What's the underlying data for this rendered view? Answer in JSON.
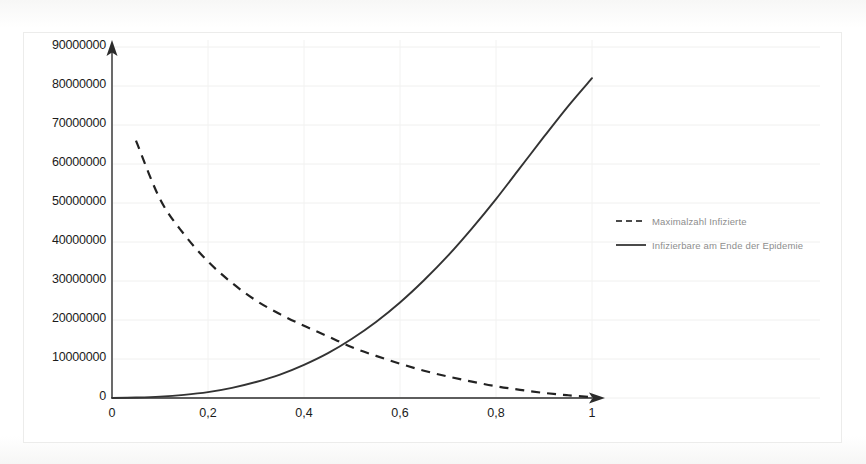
{
  "chart_data": {
    "type": "line",
    "title": "",
    "subtitle": "",
    "xlabel": "",
    "ylabel": "",
    "xlim": [
      0,
      1
    ],
    "ylim": [
      0,
      90000000
    ],
    "grid": true,
    "legend_position": "right",
    "x_tick_labels": [
      "0",
      "0,2",
      "0,4",
      "0,6",
      "0,8",
      "1"
    ],
    "x_tick_values": [
      0,
      0.2,
      0.4,
      0.6,
      0.8,
      1
    ],
    "y_tick_labels": [
      "90000000",
      "80000000",
      "70000000",
      "60000000",
      "50000000",
      "40000000",
      "30000000",
      "20000000",
      "10000000",
      "0"
    ],
    "y_tick_values": [
      90000000,
      80000000,
      70000000,
      60000000,
      50000000,
      40000000,
      30000000,
      20000000,
      10000000,
      0
    ],
    "x": [
      0.05,
      0.1,
      0.15,
      0.2,
      0.25,
      0.3,
      0.35,
      0.4,
      0.45,
      0.5,
      0.55,
      0.6,
      0.65,
      0.7,
      0.75,
      0.8,
      0.85,
      0.9,
      0.95,
      1.0
    ],
    "series": [
      {
        "name": "Maximalzahl Infizierte",
        "style": "dashed",
        "color": "#222222",
        "values": [
          66000000,
          51000000,
          42000000,
          35000000,
          29500000,
          25000000,
          21500000,
          18500000,
          15800000,
          13000000,
          10800000,
          8800000,
          7000000,
          5500000,
          4200000,
          3000000,
          2100000,
          1300000,
          700000,
          200000
        ]
      },
      {
        "name": "Infizierbare am Ende der Epidemie",
        "style": "solid",
        "color": "#333333",
        "values": [
          120000,
          350000,
          800000,
          1500000,
          2600000,
          4100000,
          6000000,
          8500000,
          11500000,
          15200000,
          19500000,
          24500000,
          30200000,
          36500000,
          43500000,
          51000000,
          59000000,
          67000000,
          74800000,
          82000000
        ]
      }
    ],
    "annotations": []
  },
  "legend": {
    "items": [
      {
        "label": "Maximalzahl Infizierte",
        "style": "dashed"
      },
      {
        "label": "Infizierbare am Ende der Epidemie",
        "style": "solid"
      }
    ]
  },
  "axes": {
    "y_ticks": [
      {
        "label": "90000000"
      },
      {
        "label": "80000000"
      },
      {
        "label": "70000000"
      },
      {
        "label": "60000000"
      },
      {
        "label": "50000000"
      },
      {
        "label": "40000000"
      },
      {
        "label": "30000000"
      },
      {
        "label": "20000000"
      },
      {
        "label": "10000000"
      },
      {
        "label": "0"
      }
    ],
    "x_ticks": [
      {
        "label": "0"
      },
      {
        "label": "0,2"
      },
      {
        "label": "0,4"
      },
      {
        "label": "0,6"
      },
      {
        "label": "0,8"
      },
      {
        "label": "1"
      }
    ]
  },
  "colors": {
    "axis": "#2b2b2b",
    "grid": "#f0f0ef",
    "dashed_series": "#222222",
    "solid_series": "#333333",
    "legend_text": "#8d8d8d",
    "tick_text": "#1b1b1b",
    "frame": "#ececeb",
    "background": "#fdfdfc"
  }
}
